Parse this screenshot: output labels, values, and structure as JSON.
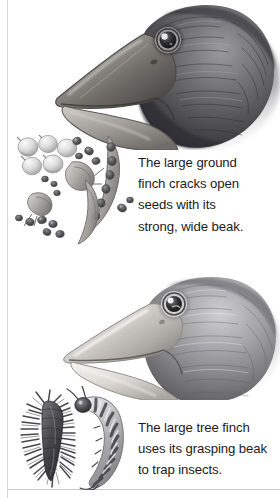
{
  "page": {
    "width": 280,
    "height": 498,
    "background": "#ffffff",
    "rule_color": "#d8d8da",
    "medium": "graphite pencil drawing"
  },
  "panels": [
    {
      "id": "large-ground-finch",
      "bird_name": "large ground finch",
      "illustration_name": "large-ground-finch-head-illustration",
      "beak_description": "thick deep conical crushing beak",
      "food_illustration_name": "seeds-and-pods-illustration",
      "food_items": [
        "round pale seeds",
        "small dark seeds",
        "pointed seed husks",
        "curved seed pods"
      ],
      "caption": "The large ground\nfinch cracks open\nseeds with its\nstrong, wide beak."
    },
    {
      "id": "large-tree-finch",
      "bird_name": "large tree finch",
      "illustration_name": "large-tree-finch-head-illustration",
      "beak_description": "lighter pointed grasping beak",
      "food_illustration_name": "caterpillars-illustration",
      "food_items": [
        "spiny caterpillar",
        "striped grub"
      ],
      "caption": "The large tree finch\nuses its grasping beak\nto trap insects."
    }
  ],
  "colors": {
    "ink_dark": "#1b1b1b",
    "graphite_dark": "#3c3c3e",
    "graphite_mid": "#8a8a8d",
    "graphite_light": "#c9c9cc",
    "paper": "#ffffff"
  }
}
